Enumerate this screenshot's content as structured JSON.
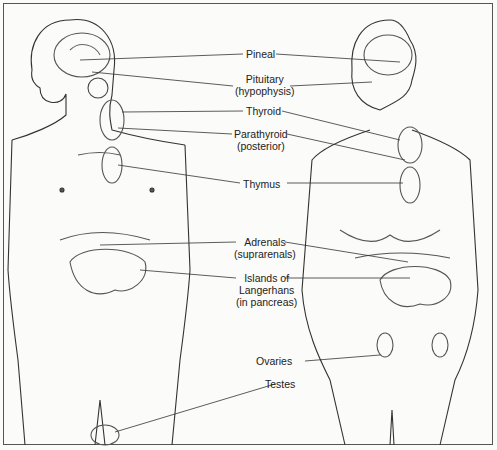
{
  "labels": {
    "pineal": "Pineal",
    "pituitary": "Pituitary",
    "pituitary_sub": "(hypophysis)",
    "thyroid": "Thyroid",
    "parathyroid": "Parathyroid",
    "parathyroid_sub": "(posterior)",
    "thymus": "Thymus",
    "adrenals": "Adrenals",
    "adrenals_sub": "(suprarenals)",
    "islands": "Islands of",
    "islands_2": "Langerhans",
    "islands_3": "(in pancreas)",
    "ovaries": "Ovaries",
    "testes": "Testes"
  },
  "figures": [
    "male-figure",
    "female-figure"
  ]
}
